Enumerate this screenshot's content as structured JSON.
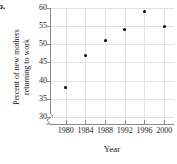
{
  "figure": {
    "part_label": "b."
  },
  "chart_data": {
    "type": "scatter",
    "title": "",
    "xlabel": "Year",
    "ylabel": "Percent of new mothers returning to work",
    "ylabel_lines": [
      "Percent of new mothers",
      "returning to work"
    ],
    "x": [
      1980,
      1984,
      1988,
      1992,
      1996,
      2000
    ],
    "values": [
      38,
      47,
      51,
      54,
      59,
      55
    ],
    "points": [
      {
        "x": 1980,
        "y": 38
      },
      {
        "x": 1984,
        "y": 47
      },
      {
        "x": 1988,
        "y": 51
      },
      {
        "x": 1992,
        "y": 54
      },
      {
        "x": 1996,
        "y": 59
      },
      {
        "x": 2000,
        "y": 55
      }
    ],
    "xticks": [
      1980,
      1984,
      1988,
      1992,
      1996,
      2000
    ],
    "xtick_labels": [
      "1980",
      "1984",
      "1988",
      "1992",
      "1996",
      "2000"
    ],
    "yticks": [
      30,
      35,
      40,
      45,
      50,
      55,
      60
    ],
    "ytick_labels": [
      "30",
      "35",
      "40",
      "45",
      "50",
      "55",
      "60"
    ],
    "xlim": [
      1977,
      2002
    ],
    "ylim": [
      28,
      60
    ],
    "grid": true,
    "legend": null,
    "y_axis_break": true,
    "marker_color": "#000000",
    "grid_color": "#e2e2e2",
    "axis_color": "#8a8a8a"
  }
}
